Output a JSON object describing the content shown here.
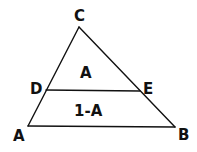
{
  "diagram": {
    "type": "triangle-with-parallel-segment",
    "stroke_color": "#111111",
    "background": "#ffffff",
    "vertices": {
      "C": {
        "label": "C",
        "x": 79,
        "y": 27
      },
      "A": {
        "label": "A",
        "x": 28,
        "y": 126
      },
      "B": {
        "label": "B",
        "x": 175,
        "y": 127
      },
      "D": {
        "label": "D",
        "x": 46,
        "y": 90
      },
      "E": {
        "label": "E",
        "x": 140,
        "y": 91
      }
    },
    "segments": [
      {
        "from": "C",
        "to": "A"
      },
      {
        "from": "C",
        "to": "B"
      },
      {
        "from": "A",
        "to": "B"
      },
      {
        "from": "D",
        "to": "E"
      }
    ],
    "regions": {
      "upper": {
        "label": "A"
      },
      "lower": {
        "label": "1-A"
      }
    }
  }
}
